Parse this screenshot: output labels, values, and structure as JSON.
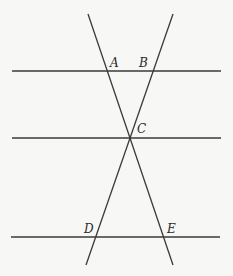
{
  "diagram": {
    "points": [
      {
        "label": "A",
        "x": 113,
        "y": 67
      },
      {
        "label": "B",
        "x": 142,
        "y": 67
      },
      {
        "label": "C",
        "x": 137,
        "y": 132
      },
      {
        "label": "D",
        "x": 84,
        "y": 233
      },
      {
        "label": "E",
        "x": 166,
        "y": 233
      }
    ],
    "horizontal_lines": [
      {
        "name": "line-AB",
        "x1": 12,
        "x2": 221,
        "y": 71
      },
      {
        "name": "line-C",
        "x1": 12,
        "x2": 221,
        "y": 138
      },
      {
        "name": "line-DE",
        "x1": 11,
        "x2": 220,
        "y": 237
      }
    ],
    "transversals": [
      {
        "name": "transversal-A-C-E",
        "x1": 88,
        "y1": 14,
        "x2": 173,
        "y2": 265
      },
      {
        "name": "transversal-B-C-D",
        "x1": 173,
        "y1": 14,
        "x2": 86,
        "y2": 265
      }
    ],
    "colors": {
      "line": "#3a3a3a",
      "background": "#f7f7f5"
    }
  }
}
